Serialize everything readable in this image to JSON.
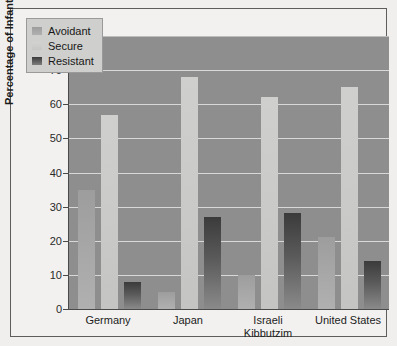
{
  "chart_data": {
    "type": "bar",
    "title": "",
    "xlabel": "",
    "ylabel": "Percentage of Infants",
    "ylim": [
      0,
      80
    ],
    "yticks": [
      0,
      10,
      20,
      30,
      40,
      50,
      60,
      70,
      80
    ],
    "grid": true,
    "legend_position": "top-left",
    "categories": [
      "Germany",
      "Japan",
      "Israeli Kibbutzim",
      "United States"
    ],
    "category_lines": [
      [
        "Germany"
      ],
      [
        "Japan"
      ],
      [
        "Israeli",
        "Kibbutzim"
      ],
      [
        "United States"
      ]
    ],
    "series": [
      {
        "name": "Avoidant",
        "values": [
          35,
          5,
          10,
          21
        ],
        "color": "#a8a8a8"
      },
      {
        "name": "Secure",
        "values": [
          57,
          68,
          62,
          65
        ],
        "color": "#c9c9c7"
      },
      {
        "name": "Resistant",
        "values": [
          8,
          27,
          28,
          14
        ],
        "color": "#4f4f4f"
      }
    ]
  },
  "legend": {
    "items": [
      {
        "label": "Avoidant"
      },
      {
        "label": "Secure"
      },
      {
        "label": "Resistant"
      }
    ]
  },
  "colors": {
    "plot_background": "#8e8e8e",
    "figure_background": "#f0efed",
    "gridline": "#d8d8d6",
    "axis": "#4a4a4a"
  }
}
